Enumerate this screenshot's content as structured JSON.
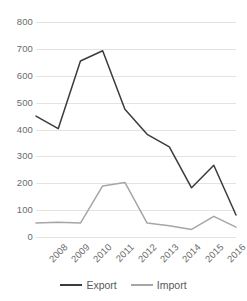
{
  "chart_data": {
    "type": "line",
    "title": "",
    "subtitle": "",
    "xlabel": "",
    "ylabel": "",
    "categories": [
      "2008",
      "2009",
      "2010",
      "2011",
      "2012",
      "2013",
      "2014",
      "2015",
      "2016",
      "2017"
    ],
    "series": [
      {
        "name": "Export",
        "color": "#3b3b3b",
        "values": [
          450,
          403,
          655,
          693,
          475,
          382,
          335,
          183,
          267,
          82
        ]
      },
      {
        "name": "Import",
        "color": "#a6a6a6",
        "values": [
          52,
          55,
          52,
          190,
          203,
          52,
          42,
          28,
          77,
          37
        ]
      }
    ],
    "ylim": [
      0,
      800
    ],
    "yticks": [
      "0",
      "100",
      "200",
      "300",
      "400",
      "500",
      "600",
      "700",
      "800"
    ],
    "grid": true,
    "legend_position": "bottom"
  },
  "legend": {
    "entries": [
      {
        "label": "Export",
        "color": "#3b3b3b"
      },
      {
        "label": "Import",
        "color": "#a6a6a6"
      }
    ]
  },
  "axis": {
    "y_tick_labels": [
      "800",
      "700",
      "600",
      "500",
      "400",
      "300",
      "200",
      "100",
      "0"
    ],
    "x_tick_labels": [
      "2008",
      "2009",
      "2010",
      "2011",
      "2012",
      "2013",
      "2014",
      "2015",
      "2016",
      "2017"
    ]
  }
}
